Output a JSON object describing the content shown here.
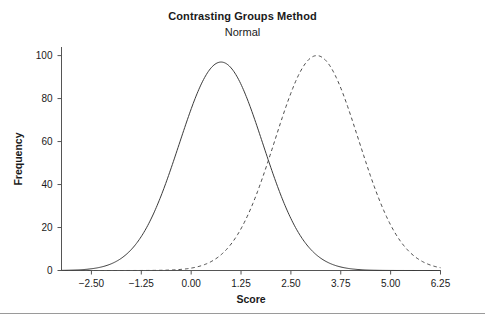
{
  "figure": {
    "title": "Contrasting Groups Method",
    "subtitle": "Normal",
    "background_color": "#ffffff",
    "axis_color": "#555555",
    "text_color": "#1a1a1a",
    "divider_color": "#9a9a9a"
  },
  "chart_data": {
    "type": "line",
    "title": "Contrasting Groups Method",
    "subtitle": "Normal",
    "xlabel": "Score",
    "ylabel": "Frequency",
    "xlim": [
      -3.25,
      6.25
    ],
    "ylim": [
      0,
      104
    ],
    "xticks": [
      -2.5,
      -1.25,
      0.0,
      1.25,
      2.5,
      3.75,
      5.0,
      6.25
    ],
    "xtick_labels": [
      "−2.50",
      "−1.25",
      "0.00",
      "1.25",
      "2.50",
      "3.75",
      "5.00",
      "6.25"
    ],
    "yticks": [
      0,
      20,
      40,
      60,
      80,
      100
    ],
    "ytick_labels": [
      "0",
      "20",
      "40",
      "60",
      "80",
      "100"
    ],
    "grid": false,
    "legend": false,
    "legend_position": "none",
    "annotations": [
      {
        "text": "curves intersect",
        "x": 1.87,
        "y": 43
      }
    ],
    "series": [
      {
        "name": "Group 1 (lower)",
        "style": "solid",
        "color": "#3a3a3a",
        "line_width": 1,
        "distribution": "normal",
        "mean": 0.75,
        "sd": 1.05,
        "peak_value": 97,
        "peak_x": 0.75,
        "x": [
          -3.25,
          -3.0,
          -2.75,
          -2.5,
          -2.25,
          -2.0,
          -1.75,
          -1.5,
          -1.25,
          -1.0,
          -0.75,
          -0.5,
          -0.25,
          0.0,
          0.25,
          0.5,
          0.75,
          1.0,
          1.25,
          1.5,
          1.75,
          2.0,
          2.25,
          2.5,
          2.75,
          3.0,
          3.25,
          3.5,
          3.75,
          4.0,
          4.25,
          4.5,
          4.75,
          5.0,
          5.25,
          5.5,
          5.75,
          6.0,
          6.25
        ],
        "y": [
          0.1,
          0.3,
          0.6,
          1.3,
          2.5,
          4.4,
          7.4,
          11.7,
          17.5,
          24.8,
          33.5,
          43.3,
          53.6,
          63.7,
          73.0,
          84.2,
          96.0,
          92.6,
          85.1,
          74.9,
          63.2,
          51.2,
          39.8,
          29.7,
          21.3,
          14.7,
          9.7,
          6.1,
          3.7,
          2.1,
          1.2,
          0.6,
          0.3,
          0.15,
          0.07,
          0.03,
          0.01,
          0.0,
          0.0
        ]
      },
      {
        "name": "Group 2 (higher)",
        "style": "dashed",
        "color": "#4a4a4a",
        "line_width": 1,
        "distribution": "normal",
        "mean": 3.15,
        "sd": 1.05,
        "peak_value": 100,
        "peak_x": 3.15,
        "x": [
          -3.25,
          -3.0,
          -2.75,
          -2.5,
          -2.25,
          -2.0,
          -1.75,
          -1.5,
          -1.25,
          -1.0,
          -0.75,
          -0.5,
          -0.25,
          0.0,
          0.25,
          0.5,
          0.75,
          1.0,
          1.25,
          1.5,
          1.75,
          2.0,
          2.25,
          2.5,
          2.75,
          3.0,
          3.25,
          3.5,
          3.75,
          4.0,
          4.25,
          4.5,
          4.75,
          5.0,
          5.25,
          5.5,
          5.75,
          6.0,
          6.25
        ],
        "y": [
          0.0,
          0.0,
          0.0,
          0.0,
          0.0,
          0.0,
          0.0,
          0.05,
          0.1,
          0.3,
          0.6,
          1.2,
          2.3,
          4.0,
          6.6,
          10.4,
          15.5,
          22.1,
          30.2,
          39.5,
          49.6,
          60.0,
          70.0,
          79.1,
          86.7,
          92.5,
          96.1,
          99.6,
          96.5,
          90.0,
          81.0,
          70.5,
          59.2,
          48.0,
          37.6,
          28.4,
          20.7,
          14.6,
          9.9
        ]
      }
    ]
  }
}
